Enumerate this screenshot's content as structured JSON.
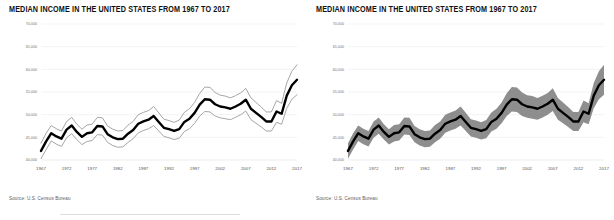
{
  "panels": [
    {
      "id": "left",
      "title": "MEDIAN INCOME IN THE UNITED STATES FROM 1967 TO 2017",
      "source": "Source: U.S. Census Bureau",
      "style": "ci-lines"
    },
    {
      "id": "right",
      "title": "MEDIAN INCOME IN THE UNITED STATES FROM 1967 TO 2017",
      "source": "Source: U.S. Census Bureau",
      "style": "ci-band"
    }
  ],
  "colors": {
    "main_line": "#000000",
    "ci_line": "#8f8f8f",
    "ci_band": "#6e6e6e",
    "gridline": "#e6e6e6",
    "background": "#ffffff",
    "title_text": "#111111",
    "axis_text": "#5c5c5c"
  },
  "chart_data": [
    {
      "type": "line",
      "title": "MEDIAN INCOME IN THE UNITED STATES FROM 1967 TO 2017",
      "xlabel": "",
      "ylabel": "",
      "xlim": [
        1967,
        2017
      ],
      "ylim": [
        40000,
        70000
      ],
      "ytick_values": [
        40000,
        45000,
        50000,
        55000,
        60000,
        65000,
        70000
      ],
      "ytick_labels": [
        "40,000",
        "45,000",
        "50,000",
        "55,000",
        "60,000",
        "65,000",
        "70,000"
      ],
      "xtick_values": [
        1967,
        1972,
        1977,
        1982,
        1987,
        1992,
        1997,
        2002,
        2007,
        2012,
        2017
      ],
      "xtick_labels": [
        "1967",
        "1972",
        "1977",
        "1982",
        "1987",
        "1992",
        "1997",
        "2002",
        "2007",
        "2012",
        "2017"
      ],
      "grid": true,
      "legend": "none",
      "annotation": "Source: U.S. Census Bureau",
      "x": [
        1967,
        1968,
        1969,
        1970,
        1971,
        1972,
        1973,
        1974,
        1975,
        1976,
        1977,
        1978,
        1979,
        1980,
        1981,
        1982,
        1983,
        1984,
        1985,
        1986,
        1987,
        1988,
        1989,
        1990,
        1991,
        1992,
        1993,
        1994,
        1995,
        1996,
        1997,
        1998,
        1999,
        2000,
        2001,
        2002,
        2003,
        2004,
        2005,
        2006,
        2007,
        2008,
        2009,
        2010,
        2011,
        2012,
        2013,
        2014,
        2015,
        2016,
        2017
      ],
      "series": [
        {
          "name": "Median income",
          "style": "bold-black",
          "values": [
            42000,
            44100,
            45900,
            45200,
            44700,
            46700,
            47600,
            46200,
            45100,
            45900,
            46100,
            47500,
            47400,
            45700,
            45000,
            44600,
            44700,
            45800,
            46600,
            48000,
            48500,
            48900,
            49700,
            48400,
            47100,
            46800,
            46400,
            46800,
            48400,
            49100,
            50400,
            52200,
            53400,
            53300,
            52300,
            51800,
            51600,
            51300,
            51800,
            52400,
            53300,
            51300,
            50400,
            49500,
            48500,
            48500,
            50700,
            50200,
            54200,
            56500,
            57700
          ]
        },
        {
          "name": "Upper bound",
          "style": "thin-gray",
          "values": [
            43700,
            45900,
            47600,
            46900,
            46400,
            48500,
            49400,
            47900,
            46800,
            47700,
            47900,
            49400,
            49300,
            47500,
            46800,
            46400,
            46500,
            47700,
            48500,
            50000,
            50500,
            50900,
            51800,
            50400,
            49000,
            48700,
            48300,
            48800,
            50500,
            51300,
            52700,
            54700,
            56100,
            56000,
            54900,
            54300,
            54100,
            53700,
            54200,
            54800,
            55800,
            53700,
            52700,
            51700,
            50600,
            50600,
            53100,
            52500,
            57000,
            59600,
            61000
          ]
        },
        {
          "name": "Lower bound",
          "style": "thin-gray",
          "values": [
            40300,
            42300,
            44200,
            43500,
            43000,
            44900,
            45800,
            44500,
            43400,
            44100,
            44300,
            45600,
            45500,
            43900,
            43200,
            42800,
            42900,
            43900,
            44700,
            46000,
            46500,
            46900,
            47600,
            46400,
            45200,
            44900,
            44500,
            44800,
            46300,
            46900,
            48100,
            49700,
            50700,
            50600,
            49700,
            49300,
            49100,
            48900,
            49400,
            50000,
            50800,
            48900,
            48100,
            47300,
            46400,
            46400,
            48300,
            47900,
            51400,
            53400,
            54400
          ]
        }
      ]
    },
    {
      "type": "line",
      "title": "MEDIAN INCOME IN THE UNITED STATES FROM 1967 TO 2017",
      "xlabel": "",
      "ylabel": "",
      "xlim": [
        1967,
        2017
      ],
      "ylim": [
        40000,
        70000
      ],
      "ytick_values": [
        40000,
        45000,
        50000,
        55000,
        60000,
        65000,
        70000
      ],
      "ytick_labels": [
        "40,000",
        "45,000",
        "50,000",
        "55,000",
        "60,000",
        "65,000",
        "70,000"
      ],
      "xtick_values": [
        1967,
        1972,
        1977,
        1982,
        1987,
        1992,
        1997,
        2002,
        2007,
        2012,
        2017
      ],
      "xtick_labels": [
        "1967",
        "1972",
        "1977",
        "1982",
        "1987",
        "1992",
        "1997",
        "2002",
        "2007",
        "2012",
        "2017"
      ],
      "grid": true,
      "legend": "none",
      "annotation": "Source: U.S. Census Bureau",
      "x": [
        1967,
        1968,
        1969,
        1970,
        1971,
        1972,
        1973,
        1974,
        1975,
        1976,
        1977,
        1978,
        1979,
        1980,
        1981,
        1982,
        1983,
        1984,
        1985,
        1986,
        1987,
        1988,
        1989,
        1990,
        1991,
        1992,
        1993,
        1994,
        1995,
        1996,
        1997,
        1998,
        1999,
        2000,
        2001,
        2002,
        2003,
        2004,
        2005,
        2006,
        2007,
        2008,
        2009,
        2010,
        2011,
        2012,
        2013,
        2014,
        2015,
        2016,
        2017
      ],
      "series": [
        {
          "name": "Median income",
          "style": "bold-black",
          "values": [
            42000,
            44100,
            45900,
            45200,
            44700,
            46700,
            47600,
            46200,
            45100,
            45900,
            46100,
            47500,
            47400,
            45700,
            45000,
            44600,
            44700,
            45800,
            46600,
            48000,
            48500,
            48900,
            49700,
            48400,
            47100,
            46800,
            46400,
            46800,
            48400,
            49100,
            50400,
            52200,
            53400,
            53300,
            52300,
            51800,
            51600,
            51300,
            51800,
            52400,
            53300,
            51300,
            50400,
            49500,
            48500,
            48500,
            50700,
            50200,
            54200,
            56500,
            57700
          ]
        },
        {
          "name": "Confidence band upper",
          "style": "gray-fill",
          "values": [
            43700,
            45900,
            47600,
            46900,
            46400,
            48500,
            49400,
            47900,
            46800,
            47700,
            47900,
            49400,
            49300,
            47500,
            46800,
            46400,
            46500,
            47700,
            48500,
            50000,
            50500,
            50900,
            51800,
            50400,
            49000,
            48700,
            48300,
            48800,
            50500,
            51300,
            52700,
            54700,
            56100,
            56000,
            54900,
            54300,
            54100,
            53700,
            54200,
            54800,
            55800,
            53700,
            52700,
            51700,
            50600,
            50600,
            53100,
            52500,
            57000,
            59600,
            61000
          ]
        },
        {
          "name": "Confidence band lower",
          "style": "gray-fill",
          "values": [
            40300,
            42300,
            44200,
            43500,
            43000,
            44900,
            45800,
            44500,
            43400,
            44100,
            44300,
            45600,
            45500,
            43900,
            43200,
            42800,
            42900,
            43900,
            44700,
            46000,
            46500,
            46900,
            47600,
            46400,
            45200,
            44900,
            44500,
            44800,
            46300,
            46900,
            48100,
            49700,
            50700,
            50600,
            49700,
            49300,
            49100,
            48900,
            49400,
            50000,
            50800,
            48900,
            48100,
            47300,
            46400,
            46400,
            48300,
            47900,
            51400,
            53400,
            54400
          ]
        }
      ]
    }
  ]
}
